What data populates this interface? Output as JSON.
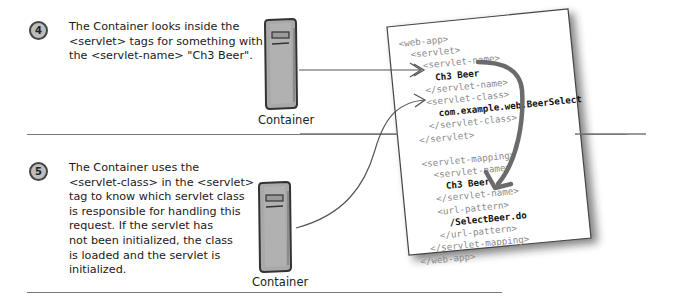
{
  "steps": [
    {
      "number": "4",
      "lines": [
        "The Container looks inside the",
        "<servlet> tags for something with",
        "the <servlet-name> \"Ch3 Beer\"."
      ],
      "container_label": "Container"
    },
    {
      "number": "5",
      "lines": [
        "The Container uses the",
        "<servlet-class> in the <servlet>",
        "tag to know which servlet class",
        "is responsible for handling this",
        "request. If the servlet has",
        "not been initialized, the class",
        "is loaded and the servlet is",
        "initialized."
      ],
      "container_label": "Container"
    }
  ],
  "deployment_descriptor": {
    "lines": [
      {
        "text": "<web-app>",
        "indent": 0,
        "kind": "tag"
      },
      {
        "text": "<servlet>",
        "indent": 1,
        "kind": "tag"
      },
      {
        "text": "<servlet-name>",
        "indent": 2,
        "kind": "tag"
      },
      {
        "text": "Ch3 Beer",
        "indent": 3,
        "kind": "val"
      },
      {
        "text": "</servlet-name>",
        "indent": 2,
        "kind": "tag"
      },
      {
        "text": "<servlet-class>",
        "indent": 2,
        "kind": "tag"
      },
      {
        "text": "com.example.web.BeerSelect",
        "indent": 3,
        "kind": "val"
      },
      {
        "text": "</servlet-class>",
        "indent": 2,
        "kind": "tag"
      },
      {
        "text": "</servlet>",
        "indent": 1,
        "kind": "tag"
      },
      {
        "text": "",
        "indent": 0,
        "kind": "blank"
      },
      {
        "text": "<servlet-mapping>",
        "indent": 1,
        "kind": "tag"
      },
      {
        "text": "<servlet-name>",
        "indent": 2,
        "kind": "tag"
      },
      {
        "text": "Ch3 Beer",
        "indent": 3,
        "kind": "val"
      },
      {
        "text": "</servlet-name>",
        "indent": 2,
        "kind": "tag"
      },
      {
        "text": "<url-pattern>",
        "indent": 2,
        "kind": "tag"
      },
      {
        "text": "/SelectBeer.do",
        "indent": 3,
        "kind": "val"
      },
      {
        "text": "</url-pattern>",
        "indent": 2,
        "kind": "tag"
      },
      {
        "text": "</servlet-mapping>",
        "indent": 1,
        "kind": "tag"
      },
      {
        "text": "</web-app>",
        "indent": 0,
        "kind": "tag"
      }
    ]
  },
  "colors": {
    "divider": "#777777",
    "server_body": "#a9a9a9",
    "arrow": "#555555",
    "code_tag": "#8a8a8a",
    "code_value": "#111111"
  }
}
